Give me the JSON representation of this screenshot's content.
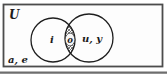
{
  "diagram": {
    "type": "venn-two-set",
    "universal_set_label": "U",
    "regions": {
      "left_only_label": "i",
      "intersection_label": "o",
      "right_only_label": "u, y",
      "outside_label": "a, e"
    },
    "colors": {
      "background": "#fdfdfd",
      "frame_border": "#4c4c4c",
      "circle_stroke": "#1e1e1e",
      "hatch_stroke": "#4a4a4a",
      "text": "#1b1b1b",
      "bottom_rule": "#6e6e6e",
      "bubble_fill": "#f6f6f6"
    }
  }
}
